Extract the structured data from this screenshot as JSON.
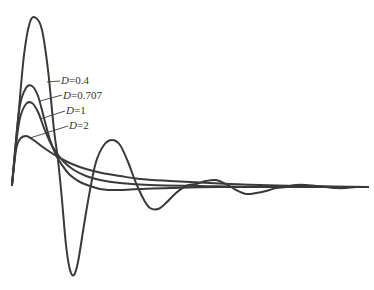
{
  "chart_data": {
    "type": "line",
    "title": "",
    "xlabel": "",
    "ylabel": "",
    "grid": false,
    "legend_position": "inline annotations near peaks",
    "x_range_px": [
      12,
      368
    ],
    "baseline_px": 187,
    "series": [
      {
        "name": "D=0.4",
        "label_var": "D",
        "label_val": "=0.4",
        "points": [
          [
            12,
            185
          ],
          [
            18,
            120
          ],
          [
            24,
            55
          ],
          [
            30,
            22
          ],
          [
            36,
            18
          ],
          [
            42,
            30
          ],
          [
            48,
            70
          ],
          [
            54,
            130
          ],
          [
            58,
            160
          ],
          [
            62,
            200
          ],
          [
            66,
            245
          ],
          [
            70,
            270
          ],
          [
            74,
            275
          ],
          [
            78,
            262
          ],
          [
            84,
            225
          ],
          [
            90,
            190
          ],
          [
            96,
            162
          ],
          [
            104,
            145
          ],
          [
            112,
            140
          ],
          [
            120,
            145
          ],
          [
            128,
            162
          ],
          [
            136,
            183
          ],
          [
            144,
            200
          ],
          [
            150,
            208
          ],
          [
            158,
            209
          ],
          [
            166,
            203
          ],
          [
            176,
            193
          ],
          [
            186,
            186
          ],
          [
            196,
            184
          ],
          [
            206,
            181
          ],
          [
            216,
            180
          ],
          [
            226,
            184
          ],
          [
            236,
            190
          ],
          [
            246,
            194
          ],
          [
            256,
            193
          ],
          [
            266,
            191
          ],
          [
            276,
            188
          ],
          [
            286,
            187
          ],
          [
            296,
            185
          ],
          [
            306,
            185
          ],
          [
            316,
            186
          ],
          [
            326,
            187
          ],
          [
            336,
            188
          ],
          [
            346,
            188
          ],
          [
            356,
            187
          ],
          [
            368,
            187
          ]
        ]
      },
      {
        "name": "D=0.707",
        "label_var": "D",
        "label_val": "=0.707",
        "points": [
          [
            12,
            185
          ],
          [
            16,
            140
          ],
          [
            20,
            105
          ],
          [
            26,
            88
          ],
          [
            32,
            86
          ],
          [
            38,
            96
          ],
          [
            44,
            118
          ],
          [
            50,
            140
          ],
          [
            56,
            155
          ],
          [
            62,
            165
          ],
          [
            70,
            175
          ],
          [
            80,
            182
          ],
          [
            90,
            186
          ],
          [
            100,
            189
          ],
          [
            110,
            190
          ],
          [
            120,
            190
          ],
          [
            140,
            189
          ],
          [
            170,
            188
          ],
          [
            220,
            187
          ],
          [
            368,
            187
          ]
        ]
      },
      {
        "name": "D=1",
        "label_var": "D",
        "label_val": "=1",
        "points": [
          [
            12,
            185
          ],
          [
            16,
            145
          ],
          [
            20,
            118
          ],
          [
            26,
            104
          ],
          [
            32,
            103
          ],
          [
            38,
            112
          ],
          [
            44,
            128
          ],
          [
            50,
            142
          ],
          [
            56,
            152
          ],
          [
            64,
            162
          ],
          [
            74,
            170
          ],
          [
            86,
            176
          ],
          [
            100,
            180
          ],
          [
            120,
            183
          ],
          [
            150,
            185
          ],
          [
            200,
            186
          ],
          [
            260,
            187
          ],
          [
            368,
            187
          ]
        ]
      },
      {
        "name": "D=2",
        "label_var": "D",
        "label_val": "=2",
        "points": [
          [
            12,
            185
          ],
          [
            16,
            150
          ],
          [
            20,
            139
          ],
          [
            26,
            136
          ],
          [
            32,
            139
          ],
          [
            40,
            145
          ],
          [
            50,
            152
          ],
          [
            60,
            158
          ],
          [
            72,
            164
          ],
          [
            86,
            169
          ],
          [
            102,
            173
          ],
          [
            120,
            176
          ],
          [
            140,
            179
          ],
          [
            170,
            181
          ],
          [
            210,
            183
          ],
          [
            260,
            185
          ],
          [
            310,
            186
          ],
          [
            368,
            187
          ]
        ]
      }
    ],
    "annotations": [
      {
        "series": "D=0.4",
        "text_x": 61,
        "text_y": 84,
        "leader": [
          [
            47,
            82
          ],
          [
            60,
            81
          ]
        ]
      },
      {
        "series": "D=0.707",
        "text_x": 63,
        "text_y": 99,
        "leader": [
          [
            40,
            101
          ],
          [
            62,
            95
          ]
        ]
      },
      {
        "series": "D=1",
        "text_x": 66,
        "text_y": 114,
        "leader": [
          [
            40,
            119
          ],
          [
            65,
            111
          ]
        ]
      },
      {
        "series": "D=2",
        "text_x": 69,
        "text_y": 129,
        "leader": [
          [
            30,
            138
          ],
          [
            68,
            126
          ]
        ]
      }
    ]
  }
}
